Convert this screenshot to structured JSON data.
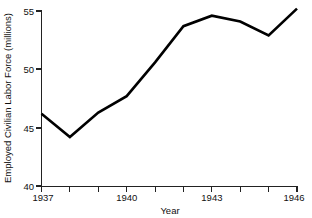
{
  "chart_data": {
    "type": "line",
    "title": "",
    "xlabel": "Year",
    "ylabel": "Employed Civilian Labor Force (millions)",
    "x": [
      1937,
      1938,
      1939,
      1940,
      1941,
      1942,
      1943,
      1944,
      1945,
      1946
    ],
    "values": [
      46.2,
      44.2,
      46.3,
      47.7,
      50.6,
      53.7,
      54.6,
      54.1,
      52.9,
      55.2
    ],
    "series": [
      {
        "name": "Employed Civilian Labor Force",
        "values": [
          46.2,
          44.2,
          46.3,
          47.7,
          50.6,
          53.7,
          54.6,
          54.1,
          52.9,
          55.2
        ]
      }
    ],
    "xlim": [
      1937,
      1946
    ],
    "ylim": [
      40,
      55
    ],
    "xticks": [
      1937,
      1938,
      1939,
      1940,
      1941,
      1942,
      1943,
      1944,
      1945,
      1946
    ],
    "xticklabels": [
      "1937",
      "",
      "",
      "1940",
      "",
      "",
      "1943",
      "",
      "",
      "1946"
    ],
    "yticks": [
      40,
      45,
      50,
      55
    ],
    "yticklabels": [
      "40",
      "45",
      "50",
      "55"
    ],
    "grid": false,
    "legend": false,
    "line_color": "#000000"
  },
  "axes": {
    "y_tick_40": "40",
    "y_tick_45": "45",
    "y_tick_50": "50",
    "y_tick_55": "55",
    "x_tick_1937": "1937",
    "x_tick_1940": "1940",
    "x_tick_1943": "1943",
    "x_tick_1946": "1946",
    "x_axis_title": "Year",
    "y_axis_title": "Employed Civilian Labor Force (millions)"
  }
}
